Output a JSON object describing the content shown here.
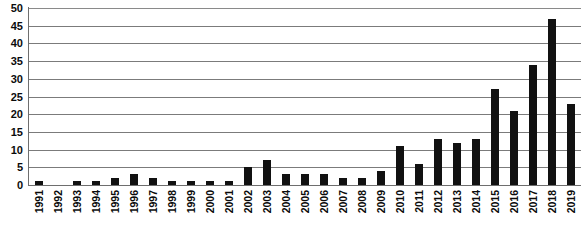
{
  "chart_data": {
    "type": "bar",
    "title": "",
    "subtitle": "",
    "xlabel": "",
    "ylabel": "",
    "ylim": [
      0,
      50
    ],
    "y_ticks": [
      0,
      5,
      10,
      15,
      20,
      25,
      30,
      35,
      40,
      45,
      50
    ],
    "grid": true,
    "legend": false,
    "legend_position": "none",
    "bar_color": "#111111",
    "gridline_color": "#7b7b7b",
    "axis_color": "#6e6e6e",
    "categories": [
      "1991",
      "1992",
      "1993",
      "1994",
      "1995",
      "1996",
      "1997",
      "1998",
      "1999",
      "2000",
      "2001",
      "2002",
      "2003",
      "2004",
      "2005",
      "2006",
      "2007",
      "2008",
      "2009",
      "2010",
      "2011",
      "2012",
      "2013",
      "2014",
      "2015",
      "2016",
      "2017",
      "2018",
      "2019"
    ],
    "values": [
      1,
      0,
      1,
      1,
      2,
      3,
      2,
      1,
      1,
      1,
      1,
      5,
      7,
      3,
      3,
      3,
      2,
      2,
      4,
      11,
      6,
      13,
      12,
      13,
      27,
      21,
      34,
      47,
      23
    ]
  }
}
